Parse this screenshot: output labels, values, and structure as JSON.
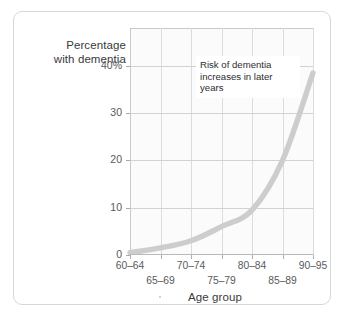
{
  "chart_data": {
    "type": "line",
    "title": "",
    "xlabel": "Age group",
    "ylabel": "Percentage with dementia",
    "ylabel_lines": [
      "Percentage",
      "with dementia"
    ],
    "categories": [
      "60–64",
      "65–69",
      "70–74",
      "75–79",
      "80–84",
      "85–89",
      "90–95"
    ],
    "values": [
      0.5,
      1.5,
      3.0,
      6.0,
      9.5,
      20.0,
      38.5
    ],
    "series": [
      {
        "name": "Percentage with dementia",
        "values": [
          0.5,
          1.5,
          3.0,
          6.0,
          9.5,
          20.0,
          38.5
        ],
        "color": "#cdcdcd"
      }
    ],
    "ylim": [
      0,
      48
    ],
    "yticks": [
      0,
      10,
      20,
      30,
      40
    ],
    "ytick_labels": [
      "0",
      "10",
      "20",
      "30",
      "40%"
    ],
    "xlim_categories": 7,
    "grid": true,
    "legend": false,
    "annotations": [
      {
        "text": "Risk of dementia increases in later years",
        "lines": [
          "Risk of dementia",
          "increases in later",
          "years"
        ]
      }
    ]
  },
  "axes": {
    "y_title_line1": "Percentage",
    "y_title_line2": "with dementia",
    "x_title": "Age group"
  },
  "colors": {
    "curve": "#cdcdcd",
    "grid": "#dcdcdc",
    "axis": "#c9c9c9",
    "text": "#59595b",
    "title_text": "#3a3a3c",
    "frame": "#d8d8d8",
    "plot_background": "#fbfbfb",
    "page_background": "#ffffff"
  }
}
